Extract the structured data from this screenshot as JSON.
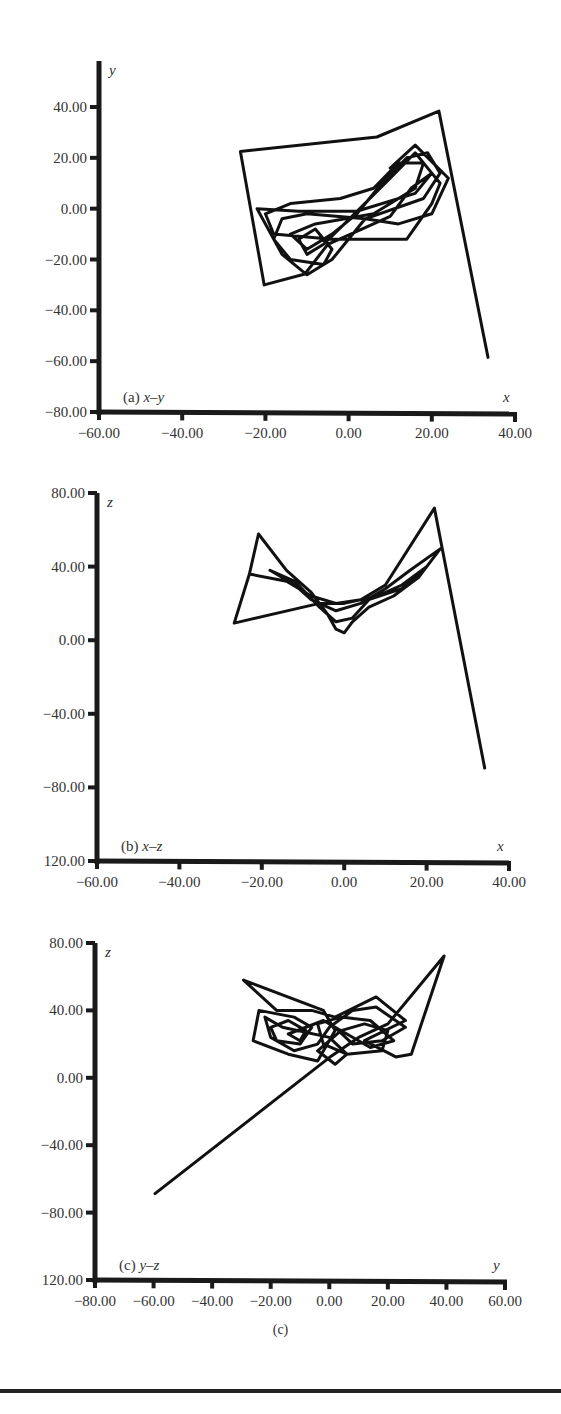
{
  "figure": {
    "caption": "(c)",
    "panels": [
      {
        "id": "a",
        "label_prefix": "(a) ",
        "label_vars": "x–y",
        "x_name": "x",
        "y_name": "y"
      },
      {
        "id": "b",
        "label_prefix": "(b) ",
        "label_vars": "x–z",
        "x_name": "x",
        "y_name": "z"
      },
      {
        "id": "c",
        "label_prefix": "(c) ",
        "label_vars": "y–z",
        "x_name": "y",
        "y_name": "z"
      }
    ]
  },
  "chart_data": [
    {
      "type": "line",
      "title": "(a) x–y",
      "xlabel": "x",
      "ylabel": "y",
      "xlim": [
        -60,
        40
      ],
      "ylim": [
        -80,
        50
      ],
      "x_ticks": [
        -60,
        -40,
        -20,
        0,
        20,
        40
      ],
      "x_tick_labels": [
        "−60.00",
        "−40.00",
        "−20.00",
        "0.00",
        "20.00",
        "40.00"
      ],
      "y_ticks": [
        40,
        20,
        0,
        -20,
        -40,
        -60,
        -80
      ],
      "y_tick_labels": [
        "40.00",
        "20.00",
        "0.00",
        "−20.00",
        "−40.00",
        "−60.00",
        "−80.00"
      ],
      "grid": false,
      "series": [
        {
          "name": "trajectory",
          "points": [
            [
              33.5,
              -58.5
            ],
            [
              21.7,
              38.4
            ],
            [
              6.8,
              28.2
            ],
            [
              -26,
              22.5
            ],
            [
              -20.3,
              -30
            ],
            [
              -10.5,
              -25.7
            ],
            [
              -5,
              -14
            ],
            [
              10,
              -3
            ],
            [
              15,
              8
            ],
            [
              20,
              14
            ],
            [
              22,
              10
            ],
            [
              20,
              2
            ],
            [
              14,
              -12
            ],
            [
              -4,
              -12
            ],
            [
              -18,
              -10
            ],
            [
              -20,
              -2
            ],
            [
              -14,
              2
            ],
            [
              -2,
              4
            ],
            [
              6,
              8
            ],
            [
              12,
              18
            ],
            [
              18,
              18
            ],
            [
              16,
              8
            ],
            [
              6,
              -2
            ],
            [
              -8,
              -6
            ],
            [
              -14,
              -10
            ],
            [
              -10,
              -16
            ],
            [
              -4,
              -10
            ],
            [
              2,
              -2
            ],
            [
              8,
              10
            ],
            [
              14,
              20
            ],
            [
              19,
              22
            ],
            [
              22,
              14
            ],
            [
              18,
              4
            ],
            [
              4,
              -4
            ],
            [
              -10,
              -2
            ],
            [
              -16,
              -4
            ],
            [
              -18,
              -12
            ],
            [
              -14,
              -20
            ],
            [
              -6,
              -22
            ],
            [
              -4,
              -16
            ],
            [
              -8,
              -8
            ],
            [
              -12,
              -12
            ],
            [
              -10,
              -18
            ],
            [
              -6,
              -14
            ],
            [
              -1,
              -6
            ],
            [
              10,
              12
            ],
            [
              16,
              22
            ],
            [
              20,
              14
            ],
            [
              16,
              6
            ],
            [
              2,
              -1
            ],
            [
              -12,
              -1
            ],
            [
              -22,
              0
            ],
            [
              -16,
              -18
            ],
            [
              -10,
              -26
            ],
            [
              -4,
              -20
            ],
            [
              4,
              -4
            ],
            [
              12,
              -6
            ],
            [
              20,
              -2
            ],
            [
              24,
              12
            ],
            [
              16,
              25
            ],
            [
              10,
              16
            ]
          ]
        }
      ]
    },
    {
      "type": "line",
      "title": "(b) x–z",
      "xlabel": "x",
      "ylabel": "z",
      "xlim": [
        -60,
        40
      ],
      "ylim": [
        -120,
        80
      ],
      "x_ticks": [
        -60,
        -40,
        -20,
        0,
        20,
        40
      ],
      "x_tick_labels": [
        "−60.00",
        "−40.00",
        "−20.00",
        "0.00",
        "20.00",
        "40.00"
      ],
      "y_ticks": [
        80,
        40,
        0,
        -40,
        -80,
        -120
      ],
      "y_tick_labels": [
        "80.00",
        "40.00",
        "0.00",
        "−40.00",
        "−80.00",
        "120.00"
      ],
      "grid": false,
      "series": [
        {
          "name": "trajectory",
          "points": [
            [
              34.1,
              -69.5
            ],
            [
              21.9,
              71.8
            ],
            [
              10,
              30
            ],
            [
              4,
              22
            ],
            [
              -2,
              20
            ],
            [
              -8,
              24
            ],
            [
              -14,
              32
            ],
            [
              -23,
              36
            ],
            [
              -20.8,
              57.7
            ],
            [
              -14,
              38
            ],
            [
              -8,
              26
            ],
            [
              -4,
              14
            ],
            [
              -2,
              6
            ],
            [
              0,
              4
            ],
            [
              2,
              10
            ],
            [
              6,
              18
            ],
            [
              12,
              24
            ],
            [
              18,
              34
            ],
            [
              23.3,
              49.6
            ],
            [
              16,
              38
            ],
            [
              10,
              28
            ],
            [
              4,
              20
            ],
            [
              -2,
              16
            ],
            [
              -8,
              22
            ],
            [
              -12,
              30
            ],
            [
              -18,
              38
            ],
            [
              -12,
              32
            ],
            [
              -6,
              18
            ],
            [
              -2,
              10
            ],
            [
              2,
              12
            ],
            [
              6,
              22
            ],
            [
              14,
              28
            ],
            [
              20,
              40
            ],
            [
              14,
              30
            ],
            [
              8,
              24
            ],
            [
              0,
              20
            ],
            [
              -6,
              20
            ],
            [
              -26.7,
              9.3
            ],
            [
              -23,
              36
            ]
          ]
        }
      ]
    },
    {
      "type": "line",
      "title": "(c) y–z",
      "xlabel": "y",
      "ylabel": "z",
      "xlim": [
        -80,
        60
      ],
      "ylim": [
        -120,
        80
      ],
      "x_ticks": [
        -80,
        -60,
        -40,
        -20,
        0,
        20,
        40,
        60
      ],
      "x_tick_labels": [
        "−80.00",
        "−60.00",
        "−40.00",
        "−20.00",
        "0.00",
        "20.00",
        "40.00",
        "60.00"
      ],
      "y_ticks": [
        80,
        40,
        0,
        -40,
        -80,
        -120
      ],
      "y_tick_labels": [
        "80.00",
        "40.00",
        "0.00",
        "−40.00",
        "−80.00",
        "120.00"
      ],
      "grid": false,
      "series": [
        {
          "name": "trajectory",
          "points": [
            [
              -59.5,
              -68.7
            ],
            [
              0,
              12
            ],
            [
              10,
              24
            ],
            [
              20,
              32
            ],
            [
              39.2,
              72.3
            ],
            [
              33,
              40
            ],
            [
              28,
              14
            ],
            [
              22.7,
              12.4
            ],
            [
              12,
              22
            ],
            [
              26,
              34
            ],
            [
              16,
              48
            ],
            [
              2,
              36
            ],
            [
              -6,
              40
            ],
            [
              -18,
              40
            ],
            [
              -29.3,
              58
            ],
            [
              -2,
              40
            ],
            [
              2,
              28
            ],
            [
              -4,
              10
            ],
            [
              -14,
              14
            ],
            [
              -26,
              22
            ],
            [
              -24,
              40
            ],
            [
              -12,
              36
            ],
            [
              -6,
              30
            ],
            [
              -10,
              20
            ],
            [
              -18,
              22
            ],
            [
              -20,
              30
            ],
            [
              -14,
              34
            ],
            [
              -8,
              28
            ],
            [
              -10,
              22
            ],
            [
              -14,
              26
            ],
            [
              -2,
              34
            ],
            [
              6,
              26
            ],
            [
              14,
              18
            ],
            [
              22,
              22
            ],
            [
              14,
              34
            ],
            [
              4,
              36
            ],
            [
              -4,
              32
            ],
            [
              -2,
              20
            ],
            [
              6,
              14
            ],
            [
              18,
              16
            ],
            [
              20,
              28
            ],
            [
              12,
              32
            ],
            [
              4,
              28
            ],
            [
              -4,
              16
            ],
            [
              2,
              8
            ],
            [
              6,
              14
            ],
            [
              0,
              24
            ],
            [
              -16,
              30
            ],
            [
              -22,
              36
            ],
            [
              -20,
              24
            ],
            [
              -12,
              16
            ],
            [
              -4,
              20
            ],
            [
              0,
              30
            ],
            [
              8,
              40
            ],
            [
              16,
              42
            ],
            [
              26,
              30
            ],
            [
              18,
              22
            ],
            [
              8,
              20
            ],
            [
              2,
              30
            ]
          ]
        }
      ]
    }
  ]
}
